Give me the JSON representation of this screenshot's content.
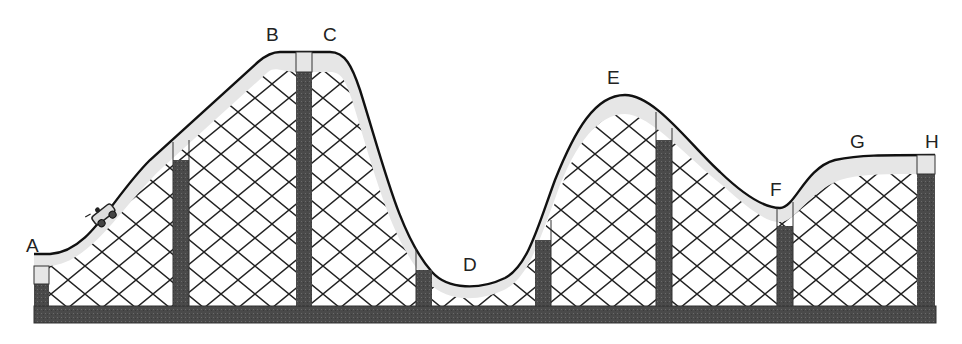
{
  "diagram": {
    "type": "roller-coaster-track",
    "colors": {
      "track_fill": "#e6e6e6",
      "track_outline": "#111111",
      "support_fill": "#4d4d4d",
      "base_fill": "#555555",
      "lattice_stroke": "#222222",
      "background": "#ffffff"
    },
    "points": [
      {
        "id": "A",
        "label": "A",
        "desc": "start, low left"
      },
      {
        "id": "B",
        "label": "B",
        "desc": "top of first hill, left"
      },
      {
        "id": "C",
        "label": "C",
        "desc": "top of first hill, right"
      },
      {
        "id": "D",
        "label": "D",
        "desc": "bottom of valley"
      },
      {
        "id": "E",
        "label": "E",
        "desc": "top of second hill"
      },
      {
        "id": "F",
        "label": "F",
        "desc": "small dip"
      },
      {
        "id": "G",
        "label": "G",
        "desc": "rise to plateau"
      },
      {
        "id": "H",
        "label": "H",
        "desc": "end, right plateau"
      }
    ],
    "car": {
      "label": "",
      "desc": "coaster car climbing from A toward B"
    }
  }
}
